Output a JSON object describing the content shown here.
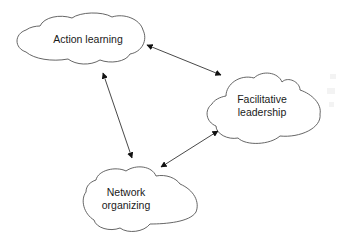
{
  "diagram": {
    "type": "concept-map",
    "nodes": [
      {
        "id": "action-learning",
        "shape": "cloud",
        "lines": [
          "Action learning"
        ]
      },
      {
        "id": "facilitative-leadership",
        "shape": "cloud",
        "lines": [
          "Facilitative",
          "leadership"
        ]
      },
      {
        "id": "network-organizing",
        "shape": "cloud",
        "lines": [
          "Network",
          "organizing"
        ]
      }
    ],
    "edges": [
      {
        "from": "action-learning",
        "to": "facilitative-leadership",
        "direction": "bidirectional"
      },
      {
        "from": "action-learning",
        "to": "network-organizing",
        "direction": "bidirectional"
      },
      {
        "from": "facilitative-leadership",
        "to": "network-organizing",
        "direction": "bidirectional"
      }
    ],
    "colors": {
      "background": "#ffffff",
      "outline": "#555555",
      "arrow": "#333333",
      "text": "#1a1a1a"
    }
  }
}
